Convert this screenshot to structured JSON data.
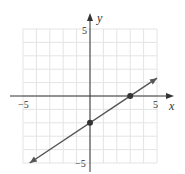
{
  "chart_data": {
    "type": "line",
    "title": "",
    "xlabel": "x",
    "ylabel": "y",
    "xlim": [
      -5,
      5
    ],
    "ylim": [
      -5,
      5
    ],
    "grid": true,
    "x_tick_labels": [
      "-5",
      "5"
    ],
    "y_tick_labels": [
      "5",
      "-5"
    ],
    "series": [
      {
        "name": "line",
        "slope": 0.6667,
        "intercept": -2,
        "x": [
          -4.5,
          5
        ],
        "y": [
          -5,
          1.333
        ],
        "arrows": "both"
      }
    ],
    "points": [
      {
        "x": 0,
        "y": -2,
        "label": "y-intercept"
      },
      {
        "x": 3,
        "y": 0,
        "label": "x-intercept"
      }
    ],
    "colors": {
      "grid": "#e4e4e4",
      "axis": "#333333",
      "line": "#555555",
      "point": "#333333"
    }
  },
  "labels": {
    "x_axis": "x",
    "y_axis": "y",
    "x_min": "−5",
    "x_max": "5",
    "y_max": "5",
    "y_min": "−5"
  }
}
